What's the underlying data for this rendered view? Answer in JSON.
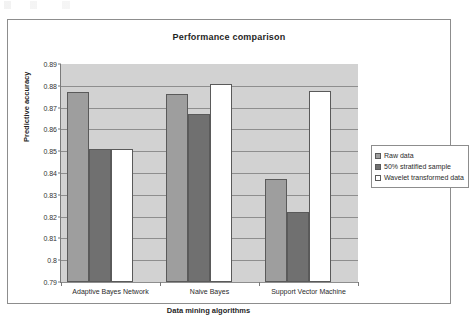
{
  "chart_data": {
    "type": "bar",
    "title": "Performance comparison",
    "xlabel": "Data mining algorithms",
    "ylabel": "Predictive accuracy",
    "categories": [
      "Adaptive Bayes Network",
      "Naive Bayes",
      "Support Vector Machine"
    ],
    "series": [
      {
        "name": "Raw data",
        "color": "#9e9e9e",
        "values": [
          0.8773,
          0.8764,
          0.8373
        ]
      },
      {
        "name": "50% stratified sample",
        "color": "#707070",
        "values": [
          0.851,
          0.867,
          0.8223
        ]
      },
      {
        "name": "Wavelet transformed data",
        "color": "#ffffff",
        "values": [
          0.8512,
          0.8809,
          0.8777
        ]
      }
    ],
    "ylim": [
      0.79,
      0.89
    ],
    "ytick_labels": [
      "0.89",
      "0.88",
      "0.87",
      "0.86",
      "0.85",
      "0.84",
      "0.83",
      "0.82",
      "0.81",
      "0.8",
      "0.79"
    ],
    "ytick_values": [
      0.89,
      0.88,
      0.87,
      0.86,
      0.85,
      0.84,
      0.83,
      0.82,
      0.81,
      0.8,
      0.79
    ],
    "grid": true,
    "legend_position": "right",
    "plot_background": "#d2d2d2"
  }
}
